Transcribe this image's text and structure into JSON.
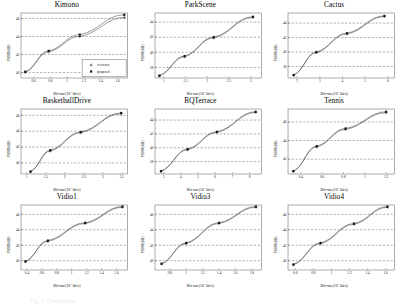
{
  "figure": {
    "caption": "Fig. 5. Comparison",
    "legend": {
      "items": [
        "reference",
        "proposed"
      ],
      "marker_ref": "+",
      "marker_prop": "■"
    },
    "axis_labels": {
      "y": "PSNR(dB)",
      "x_prefix": "Bit-rate(10",
      "x_exp": "3",
      "x_suffix": " kb/s)"
    },
    "colors": {
      "curve": "#4a4a4a",
      "grid": "#3a3a3a",
      "axis": "#6b6b6b",
      "marker": "#1a1a1a"
    }
  },
  "chart_data": [
    {
      "type": "line",
      "title": "Kimono",
      "xlabel": "Bit-rate(10^3 kb/s)",
      "ylabel": "PSNR(dB)",
      "xlim": [
        0.45,
        1.72
      ],
      "ylim": [
        39.4,
        46.6
      ],
      "xticks": [
        0.6,
        0.8,
        1,
        1.2,
        1.4,
        1.6
      ],
      "yticks": [
        40,
        42,
        44,
        46
      ],
      "grid": true,
      "legend": true,
      "legend_position": "lower right",
      "series": [
        {
          "name": "reference",
          "x": [
            0.5,
            0.78,
            1.15,
            1.68
          ],
          "y": [
            40.0,
            42.3,
            44.0,
            46.1
          ]
        },
        {
          "name": "proposed",
          "x": [
            0.5,
            0.78,
            1.15,
            1.68
          ],
          "y": [
            40.1,
            42.4,
            44.2,
            46.4
          ]
        }
      ]
    },
    {
      "type": "line",
      "title": "ParkScene",
      "xlabel": "Bit-rate(10^3 kb/s)",
      "ylabel": "PSNR(dB)",
      "xlim": [
        0.8,
        3.25
      ],
      "ylim": [
        36.6,
        45.2
      ],
      "xticks": [
        1,
        1.5,
        2,
        2.5,
        3
      ],
      "yticks": [
        38,
        40,
        42,
        44
      ],
      "grid": true,
      "legend": false,
      "series": [
        {
          "name": "reference",
          "x": [
            0.9,
            1.48,
            2.15,
            3.05
          ],
          "y": [
            36.9,
            39.4,
            41.9,
            44.6
          ]
        },
        {
          "name": "proposed",
          "x": [
            0.9,
            1.48,
            2.15,
            3.05
          ],
          "y": [
            36.9,
            39.5,
            42.0,
            44.7
          ]
        }
      ]
    },
    {
      "type": "line",
      "title": "Cactus",
      "xlabel": "Bit-rate(10^3 kb/s)",
      "ylabel": "PSNR(dB)",
      "xlim": [
        1.6,
        6.3
      ],
      "ylim": [
        36.4,
        45.4
      ],
      "xticks": [
        2,
        3,
        4,
        5,
        6
      ],
      "yticks": [
        38,
        40,
        42,
        44
      ],
      "grid": true,
      "legend": false,
      "series": [
        {
          "name": "reference",
          "x": [
            1.85,
            2.85,
            4.2,
            5.85
          ],
          "y": [
            36.8,
            39.9,
            42.5,
            44.9
          ]
        },
        {
          "name": "proposed",
          "x": [
            1.85,
            2.85,
            4.2,
            5.85
          ],
          "y": [
            36.8,
            40.0,
            42.6,
            45.0
          ]
        }
      ]
    },
    {
      "type": "line",
      "title": "BasketballDrive",
      "xlabel": "Bit-rate(10^3 kb/s)",
      "ylabel": "PSNR(dB)",
      "xlim": [
        0.85,
        3.65
      ],
      "ylim": [
        38.6,
        46.8
      ],
      "xticks": [
        1,
        1.5,
        2,
        2.5,
        3,
        3.5
      ],
      "yticks": [
        40,
        42,
        44,
        46
      ],
      "grid": true,
      "legend": false,
      "series": [
        {
          "name": "reference",
          "x": [
            1.1,
            1.62,
            2.42,
            3.48
          ],
          "y": [
            38.9,
            41.5,
            43.8,
            46.2
          ]
        },
        {
          "name": "proposed",
          "x": [
            1.1,
            1.62,
            2.42,
            3.48
          ],
          "y": [
            38.9,
            41.6,
            43.9,
            46.3
          ]
        }
      ]
    },
    {
      "type": "line",
      "title": "BQTerrace",
      "xlabel": "Bit-rate(10^3 kb/s)",
      "ylabel": "PSNR(dB)",
      "xlim": [
        2.5,
        8.7
      ],
      "ylim": [
        36.2,
        45.6
      ],
      "xticks": [
        3,
        4,
        5,
        6,
        7,
        8
      ],
      "yticks": [
        38,
        40,
        42,
        44
      ],
      "grid": true,
      "legend": false,
      "series": [
        {
          "name": "reference",
          "x": [
            2.85,
            4.4,
            6.1,
            8.35
          ],
          "y": [
            36.6,
            39.7,
            42.2,
            45.1
          ]
        },
        {
          "name": "proposed",
          "x": [
            2.85,
            4.4,
            6.1,
            8.35
          ],
          "y": [
            36.6,
            39.8,
            42.3,
            45.2
          ]
        }
      ]
    },
    {
      "type": "line",
      "title": "Tennis",
      "xlabel": "Bit-rate(10^3 kb/s)",
      "ylabel": "PSNR(dB)",
      "xlim": [
        0.28,
        1.28
      ],
      "ylim": [
        40.4,
        47.4
      ],
      "xticks": [
        0.4,
        0.6,
        0.8,
        1,
        1.2
      ],
      "yticks": [
        42,
        44,
        46
      ],
      "grid": true,
      "legend": false,
      "series": [
        {
          "name": "reference",
          "x": [
            0.33,
            0.55,
            0.82,
            1.2
          ],
          "y": [
            40.7,
            43.3,
            45.2,
            47.0
          ]
        },
        {
          "name": "proposed",
          "x": [
            0.33,
            0.55,
            0.82,
            1.2
          ],
          "y": [
            40.7,
            43.4,
            45.3,
            47.1
          ]
        }
      ]
    },
    {
      "type": "line",
      "title": "Vidio1",
      "xlabel": "Bit-rate(10^3 kb/s)",
      "ylabel": "PSNR(dB)",
      "xlim": [
        0.32,
        1.75
      ],
      "ylim": [
        38.8,
        47.2
      ],
      "xticks": [
        0.4,
        0.6,
        0.8,
        1,
        1.2,
        1.4,
        1.6
      ],
      "yticks": [
        40,
        42,
        44,
        46
      ],
      "grid": true,
      "legend": false,
      "series": [
        {
          "name": "reference",
          "x": [
            0.38,
            0.68,
            1.18,
            1.68
          ],
          "y": [
            39.9,
            42.5,
            44.8,
            46.9
          ]
        },
        {
          "name": "proposed",
          "x": [
            0.38,
            0.68,
            1.18,
            1.68
          ],
          "y": [
            39.9,
            42.6,
            44.9,
            47.0
          ]
        }
      ]
    },
    {
      "type": "line",
      "title": "Vidio3",
      "xlabel": "Bit-rate(10^3 kb/s)",
      "ylabel": "PSNR(dB)",
      "xlim": [
        0.62,
        1.92
      ],
      "ylim": [
        38.8,
        47.2
      ],
      "xticks": [
        0.8,
        1,
        1.2,
        1.4,
        1.6,
        1.8
      ],
      "yticks": [
        40,
        42,
        44,
        46
      ],
      "grid": true,
      "legend": false,
      "series": [
        {
          "name": "reference",
          "x": [
            0.7,
            1.0,
            1.4,
            1.85
          ],
          "y": [
            39.6,
            42.2,
            44.8,
            46.9
          ]
        },
        {
          "name": "proposed",
          "x": [
            0.7,
            1.0,
            1.4,
            1.85
          ],
          "y": [
            39.6,
            42.3,
            44.9,
            47.0
          ]
        }
      ]
    },
    {
      "type": "line",
      "title": "Vidio4",
      "xlabel": "Bit-rate(10^3 kb/s)",
      "ylabel": "PSNR(dB)",
      "xlim": [
        0.52,
        1.7
      ],
      "ylim": [
        38.8,
        47.2
      ],
      "xticks": [
        0.6,
        0.8,
        1,
        1.2,
        1.4,
        1.6
      ],
      "yticks": [
        40,
        42,
        44,
        46
      ],
      "grid": true,
      "legend": false,
      "series": [
        {
          "name": "reference",
          "x": [
            0.58,
            0.88,
            1.25,
            1.62
          ],
          "y": [
            39.5,
            42.2,
            44.7,
            46.9
          ]
        },
        {
          "name": "proposed",
          "x": [
            0.58,
            0.88,
            1.25,
            1.62
          ],
          "y": [
            39.5,
            42.3,
            44.8,
            47.0
          ]
        }
      ]
    }
  ]
}
